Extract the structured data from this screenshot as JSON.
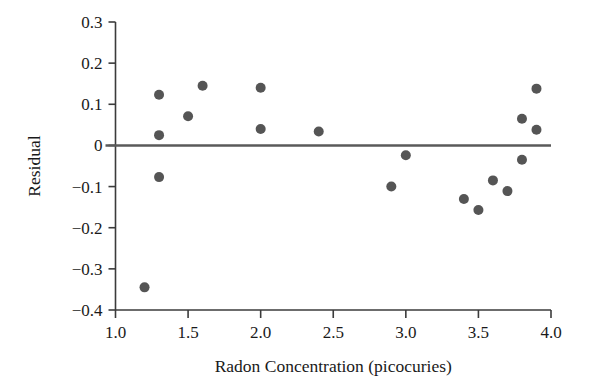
{
  "chart_data": {
    "type": "scatter",
    "title": "",
    "xlabel": "Radon Concentration (picocuries)",
    "ylabel": "Residual",
    "xlim": [
      1.0,
      4.0
    ],
    "ylim": [
      -0.4,
      0.3
    ],
    "xticks": [
      1.0,
      1.5,
      2.0,
      2.5,
      3.0,
      3.5,
      4.0
    ],
    "xtick_labels": [
      "1.0",
      "1.5",
      "2.0",
      "2.5",
      "3.0",
      "3.5",
      "4.0"
    ],
    "yticks": [
      0.3,
      0.2,
      0.1,
      0.0,
      -0.1,
      -0.2,
      -0.3,
      -0.4
    ],
    "ytick_labels": [
      "0.3",
      "0.2",
      "0.1",
      "0",
      "−0.1",
      "−0.2",
      "−0.3",
      "−0.4"
    ],
    "grid": false,
    "legend": null,
    "reference_line": {
      "orientation": "horizontal",
      "y": 0.0,
      "color": "#5a5a5a"
    },
    "marker": {
      "shape": "circle",
      "color": "#555555",
      "size": 9
    },
    "x": [
      1.2,
      1.3,
      1.3,
      1.3,
      1.5,
      1.6,
      2.0,
      2.0,
      2.4,
      2.9,
      3.0,
      3.4,
      3.5,
      3.6,
      3.7,
      3.8,
      3.8,
      3.9,
      3.9
    ],
    "y": [
      -0.345,
      0.123,
      0.025,
      -0.077,
      0.071,
      0.145,
      0.14,
      0.04,
      0.034,
      -0.1,
      -0.024,
      -0.13,
      -0.157,
      -0.085,
      -0.111,
      0.065,
      -0.035,
      0.138,
      0.038
    ],
    "points": [
      {
        "x": 1.2,
        "y": -0.345
      },
      {
        "x": 1.3,
        "y": 0.123
      },
      {
        "x": 1.3,
        "y": 0.025
      },
      {
        "x": 1.3,
        "y": -0.077
      },
      {
        "x": 1.5,
        "y": 0.071
      },
      {
        "x": 1.6,
        "y": 0.145
      },
      {
        "x": 2.0,
        "y": 0.14
      },
      {
        "x": 2.0,
        "y": 0.04
      },
      {
        "x": 2.4,
        "y": 0.034
      },
      {
        "x": 2.9,
        "y": -0.1
      },
      {
        "x": 3.0,
        "y": -0.024
      },
      {
        "x": 3.4,
        "y": -0.13
      },
      {
        "x": 3.5,
        "y": -0.157
      },
      {
        "x": 3.6,
        "y": -0.085
      },
      {
        "x": 3.7,
        "y": -0.111
      },
      {
        "x": 3.8,
        "y": 0.065
      },
      {
        "x": 3.8,
        "y": -0.035
      },
      {
        "x": 3.9,
        "y": 0.138
      },
      {
        "x": 3.9,
        "y": 0.038
      }
    ]
  },
  "colors": {
    "marker": "#555555",
    "axis": "#3b3b3b",
    "zero_line": "#5a5a5a",
    "text": "#1a1a1a",
    "background": "#ffffff"
  }
}
